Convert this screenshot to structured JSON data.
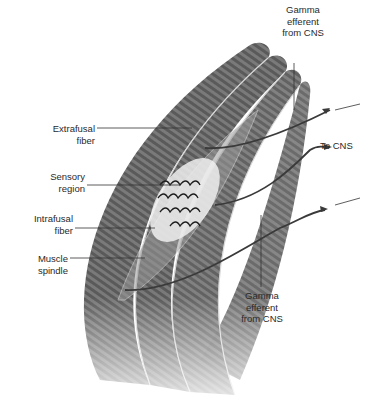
{
  "figure": {
    "labels": {
      "gamma_top": {
        "line1": "Gamma",
        "line2": "efferent",
        "line3": "from CNS"
      },
      "extrafusal": {
        "line1": "Extrafusal",
        "line2": "fiber"
      },
      "to_cns": {
        "text": "To CNS"
      },
      "sensory": {
        "line1": "Sensory",
        "line2": "region"
      },
      "intrafusal": {
        "line1": "Intrafusal",
        "line2": "fiber"
      },
      "spindle": {
        "line1": "Muscle",
        "line2": "spindle"
      },
      "gamma_bottom": {
        "line1": "Gamma",
        "line2": "efferent",
        "line3": "from CNS"
      }
    },
    "colors": {
      "muscle_dark": "#5e5e5e",
      "muscle_mid": "#8a8a8a",
      "muscle_light": "#bdbdbd",
      "nerve": "#3a3a3a",
      "text": "#2a2a2a",
      "background": "#ffffff"
    }
  }
}
